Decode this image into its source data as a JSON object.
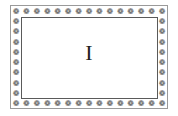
{
  "card": {
    "letter": "I",
    "border_glyph": "❁",
    "top_count": 15,
    "side_count": 10,
    "colors": {
      "glyph": "#4a4a4a",
      "outer_border": "#9a9a9a",
      "inner_border": "#5a5a5a",
      "letter": "#222222"
    }
  }
}
